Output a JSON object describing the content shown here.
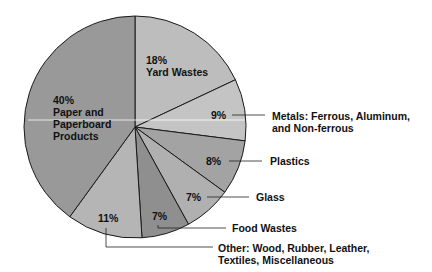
{
  "chart_data": {
    "type": "pie",
    "title": "",
    "start_angle_deg": 0,
    "direction": "clockwise",
    "center": [
      135,
      127
    ],
    "radius": 111,
    "slices": [
      {
        "label": "Yard Wastes",
        "value": 18,
        "pct_text": "18%",
        "color": "#bdbdbd"
      },
      {
        "label": "Metals: Ferrous, Aluminum, and Non-ferrous",
        "value": 9,
        "pct_text": "9%",
        "color": "#c4c4c4"
      },
      {
        "label": "Plastics",
        "value": 8,
        "pct_text": "8%",
        "color": "#a3a3a3"
      },
      {
        "label": "Glass",
        "value": 7,
        "pct_text": "7%",
        "color": "#b0b0b0"
      },
      {
        "label": "Food Wastes",
        "value": 7,
        "pct_text": "7%",
        "color": "#8f8f8f"
      },
      {
        "label": "Other: Wood, Rubber, Leather, Textiles, Miscellaneous",
        "value": 11,
        "pct_text": "11%",
        "color": "#b5b5b5"
      },
      {
        "label": "Paper and Paperboard Products",
        "value": 40,
        "pct_text": "40%",
        "color": "#999999"
      }
    ]
  },
  "labels": {
    "yard": {
      "pct": "18%",
      "line1": "Yard Wastes"
    },
    "paper": {
      "pct": "40%",
      "line1": "Paper and",
      "line2": "Paperboard",
      "line3": "Products"
    },
    "metals": {
      "pct": "9%",
      "line1": "Metals: Ferrous, Aluminum,",
      "line2": "and Non-ferrous"
    },
    "plastics": {
      "pct": "8%",
      "line1": "Plastics"
    },
    "glass": {
      "pct": "7%",
      "line1": "Glass"
    },
    "food": {
      "pct": "7%",
      "line1": "Food Wastes"
    },
    "other": {
      "pct": "11%",
      "line1": "Other: Wood, Rubber, Leather,",
      "line2": "Textiles, Miscellaneous"
    }
  }
}
